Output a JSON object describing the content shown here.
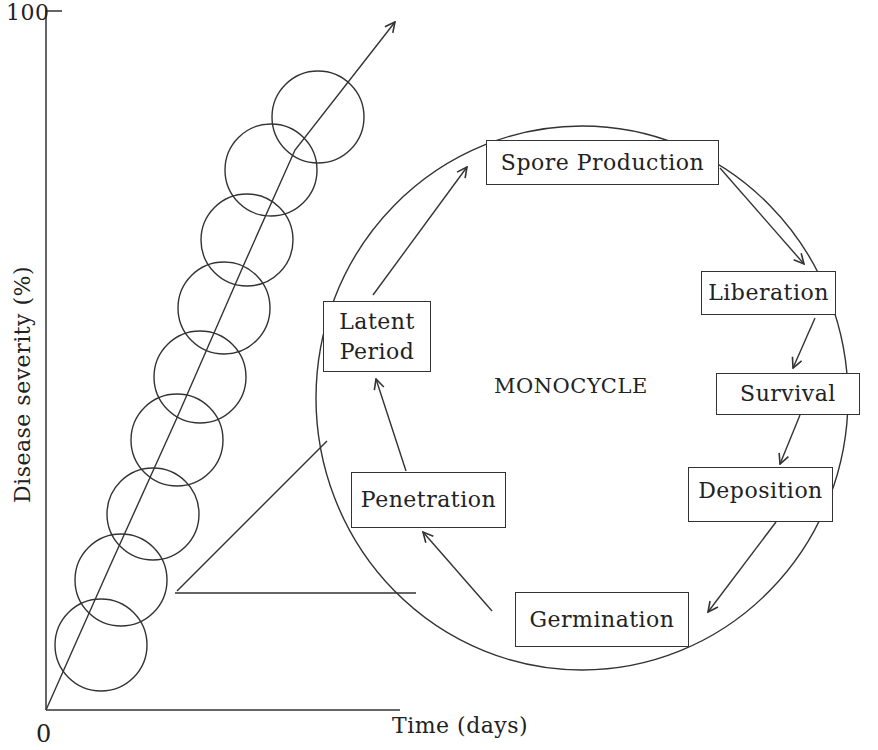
{
  "axes": {
    "y_label": "Disease severity (%)",
    "y_max_tick": "100",
    "x_label": "Time (days)",
    "origin": "0"
  },
  "center_label": "MONOCYCLE",
  "stages": [
    {
      "id": "spore-production",
      "label": "Spore Production"
    },
    {
      "id": "liberation",
      "label": "Liberation"
    },
    {
      "id": "survival",
      "label": "Survival"
    },
    {
      "id": "deposition",
      "label": "Deposition"
    },
    {
      "id": "germination",
      "label": "Germination"
    },
    {
      "id": "penetration",
      "label": "Penetration"
    },
    {
      "id": "latent-period",
      "label": "Latent\nPeriod"
    }
  ],
  "cycle_order": [
    "Spore Production",
    "Liberation",
    "Survival",
    "Deposition",
    "Germination",
    "Penetration",
    "Latent Period",
    "Spore Production"
  ],
  "polycycle": {
    "monocycle_count": 9,
    "trend": "increasing disease severity over time"
  },
  "colors": {
    "line": "#333333",
    "background": "#ffffff",
    "text": "#222222"
  }
}
